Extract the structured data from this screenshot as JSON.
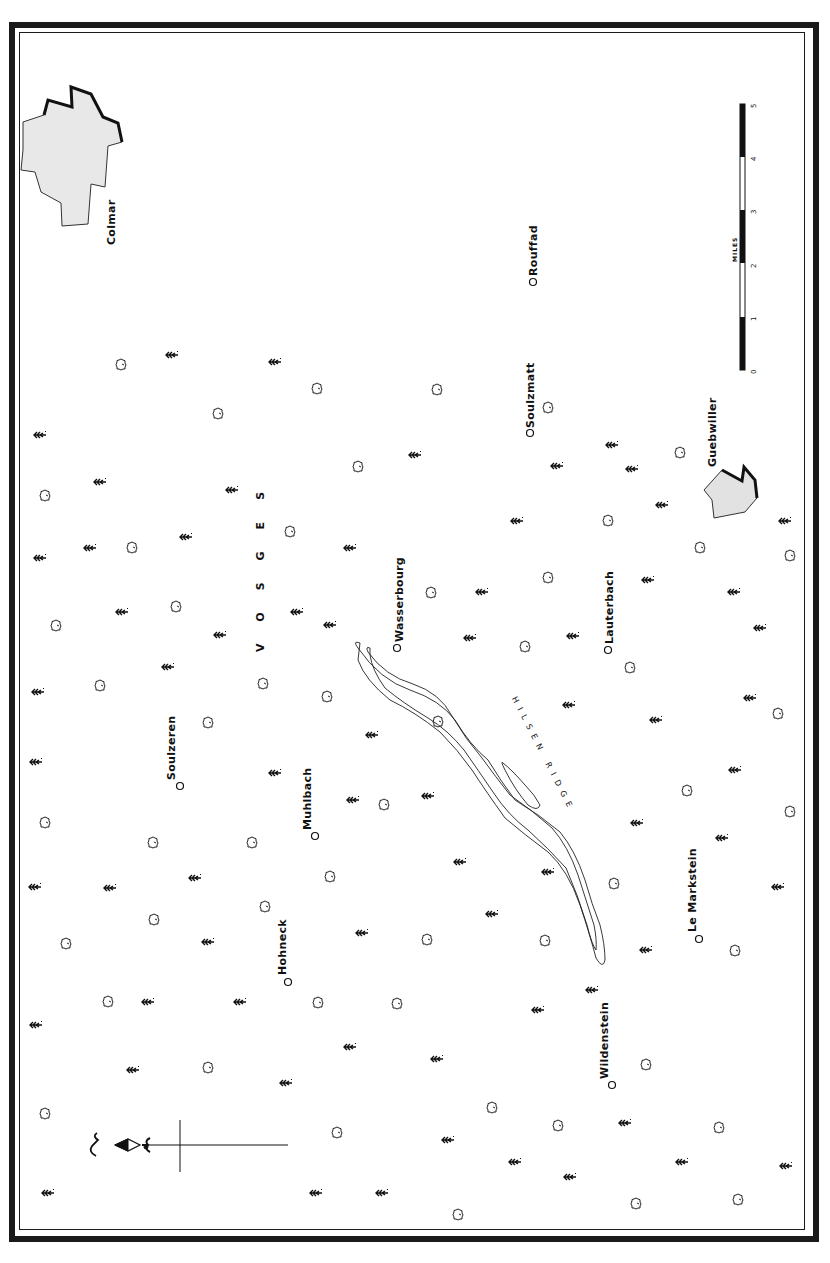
{
  "map": {
    "orientation": "north-left",
    "region_label": "VOSGES",
    "ridge_label": "HILSEN RIDGE",
    "towns": [
      {
        "name": "Colmar",
        "x": 110,
        "y": 245,
        "type": "city"
      },
      {
        "name": "Rouffad",
        "x": 533,
        "y": 282,
        "type": "village"
      },
      {
        "name": "Soulzmatt",
        "x": 530,
        "y": 433,
        "type": "village"
      },
      {
        "name": "Guebwiller",
        "x": 712,
        "y": 470,
        "type": "city"
      },
      {
        "name": "Wasserbourg",
        "x": 397,
        "y": 648,
        "type": "village"
      },
      {
        "name": "Lauterbach",
        "x": 608,
        "y": 650,
        "type": "village"
      },
      {
        "name": "Soulzeren",
        "x": 180,
        "y": 786,
        "type": "village"
      },
      {
        "name": "Muhlbach",
        "x": 315,
        "y": 836,
        "type": "village"
      },
      {
        "name": "Le Markstein",
        "x": 699,
        "y": 939,
        "type": "village"
      },
      {
        "name": "Hohneck",
        "x": 288,
        "y": 982,
        "type": "summit"
      },
      {
        "name": "Wildenstein",
        "x": 612,
        "y": 1085,
        "type": "village"
      }
    ],
    "scale": {
      "unit_label": "MILES",
      "ticks": [
        "0",
        "1",
        "2",
        "3",
        "4",
        "5"
      ]
    },
    "compass": {
      "symbol": "north-arrow-fleur-de-lis",
      "letter": "N"
    },
    "colors": {
      "ink": "#1a1a1a",
      "fill": "#e6e6e6",
      "paper": "#ffffff"
    }
  }
}
